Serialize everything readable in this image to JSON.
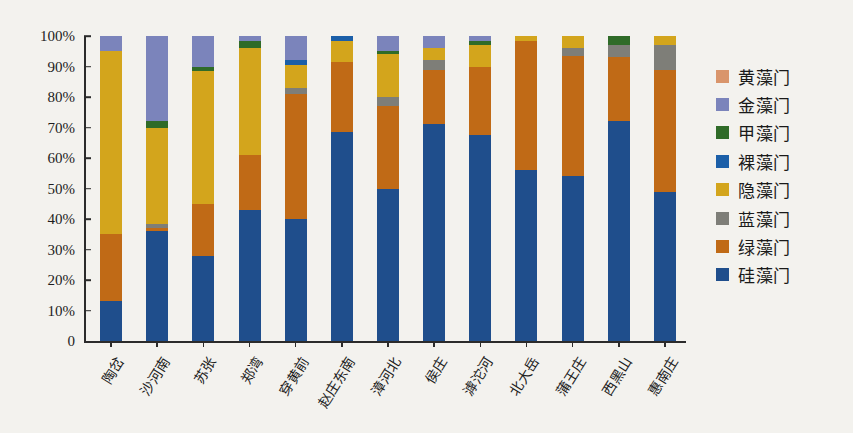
{
  "chart_data": {
    "type": "bar",
    "subtype": "stacked-percentage",
    "title": "",
    "xlabel": "",
    "ylabel": "",
    "ylim": [
      0,
      100
    ],
    "y_ticks": [
      "0",
      "10%",
      "20%",
      "30%",
      "40%",
      "50%",
      "60%",
      "70%",
      "80%",
      "90%",
      "100%"
    ],
    "y_tick_values": [
      0,
      10,
      20,
      30,
      40,
      50,
      60,
      70,
      80,
      90,
      100
    ],
    "grid": false,
    "legend_position": "right",
    "categories": [
      "陶岔",
      "沙河南",
      "苏张",
      "郑湾",
      "穿黄前",
      "赵庄东南",
      "漳河北",
      "侯庄",
      "滹沱河",
      "北大岳",
      "蒲王庄",
      "西黑山",
      "惠南庄"
    ],
    "series": [
      {
        "name": "硅藻门",
        "color": "#1f4e8c",
        "values": [
          13.0,
          36.0,
          28.0,
          43.0,
          40.0,
          68.5,
          50.0,
          71.0,
          67.5,
          56.0,
          54.0,
          72.0,
          49.0
        ]
      },
      {
        "name": "绿藻门",
        "color": "#c06a16",
        "values": [
          22.0,
          1.0,
          17.0,
          18.0,
          41.0,
          23.0,
          27.0,
          18.0,
          22.5,
          42.5,
          39.5,
          21.0,
          40.0
        ]
      },
      {
        "name": "蓝藻门",
        "color": "#7e7e78",
        "values": [
          0.0,
          1.5,
          0.0,
          0.0,
          2.0,
          0.0,
          3.0,
          3.0,
          0.0,
          0.0,
          2.5,
          4.0,
          8.0
        ]
      },
      {
        "name": "隐藻门",
        "color": "#d3a51c",
        "values": [
          60.0,
          31.5,
          43.5,
          35.0,
          7.5,
          7.0,
          14.0,
          4.0,
          7.0,
          1.5,
          4.0,
          0.0,
          3.0
        ]
      },
      {
        "name": "裸藻门",
        "color": "#1b5fa8",
        "values": [
          0.0,
          0.0,
          0.0,
          0.0,
          1.5,
          1.5,
          0.0,
          0.0,
          0.0,
          0.0,
          0.0,
          0.0,
          0.0
        ]
      },
      {
        "name": "甲藻门",
        "color": "#2f6b28",
        "values": [
          0.0,
          2.0,
          1.5,
          2.5,
          0.0,
          0.0,
          1.0,
          0.0,
          1.5,
          0.0,
          0.0,
          3.0,
          0.0
        ]
      },
      {
        "name": "金藻门",
        "color": "#7b84bb",
        "values": [
          5.0,
          28.0,
          10.0,
          1.5,
          8.0,
          0.0,
          5.0,
          4.0,
          1.5,
          0.0,
          0.0,
          0.0,
          0.0
        ]
      },
      {
        "name": "黄藻门",
        "color": "#d9956b",
        "values": [
          0.0,
          0.0,
          0.0,
          0.0,
          0.0,
          0.0,
          0.0,
          0.0,
          0.0,
          0.0,
          0.0,
          0.0,
          0.0
        ]
      }
    ],
    "legend_order": [
      "黄藻门",
      "金藻门",
      "甲藻门",
      "裸藻门",
      "隐藻门",
      "蓝藻门",
      "绿藻门",
      "硅藻门"
    ]
  },
  "legend": {
    "items": [
      {
        "label": "黄藻门",
        "color": "#d9956b"
      },
      {
        "label": "金藻门",
        "color": "#7b84bb"
      },
      {
        "label": "甲藻门",
        "color": "#2f6b28"
      },
      {
        "label": "裸藻门",
        "color": "#1b5fa8"
      },
      {
        "label": "隐藻门",
        "color": "#d3a51c"
      },
      {
        "label": "蓝藻门",
        "color": "#7e7e78"
      },
      {
        "label": "绿藻门",
        "color": "#c06a16"
      },
      {
        "label": "硅藻门",
        "color": "#1f4e8c"
      }
    ]
  }
}
